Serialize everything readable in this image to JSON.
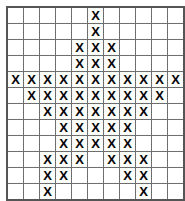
{
  "figure": {
    "type": "cross-stitch-pattern-grid",
    "columns": 11,
    "rows": 12,
    "mark_symbol": "X",
    "empty_symbol": "",
    "grid_line_color": "#6e6e6e",
    "border_color": "#555555",
    "mark_color": "#000000",
    "background_color": "#ffffff",
    "cells": [
      [
        "",
        "",
        "",
        "",
        "",
        "X",
        "",
        "",
        "",
        "",
        ""
      ],
      [
        "",
        "",
        "",
        "",
        "",
        "X",
        "",
        "",
        "",
        "",
        ""
      ],
      [
        "",
        "",
        "",
        "",
        "X",
        "X",
        "X",
        "",
        "",
        "",
        ""
      ],
      [
        "",
        "",
        "",
        "",
        "X",
        "X",
        "X",
        "",
        "",
        "",
        ""
      ],
      [
        "X",
        "X",
        "X",
        "X",
        "X",
        "X",
        "X",
        "X",
        "X",
        "X",
        "X"
      ],
      [
        "",
        "X",
        "X",
        "X",
        "X",
        "X",
        "X",
        "X",
        "X",
        "X",
        ""
      ],
      [
        "",
        "",
        "X",
        "X",
        "X",
        "X",
        "X",
        "X",
        "X",
        "",
        ""
      ],
      [
        "",
        "",
        "",
        "X",
        "X",
        "X",
        "X",
        "X",
        "",
        "",
        ""
      ],
      [
        "",
        "",
        "",
        "X",
        "X",
        "X",
        "X",
        "X",
        "",
        "",
        ""
      ],
      [
        "",
        "",
        "X",
        "X",
        "X",
        "",
        "X",
        "X",
        "X",
        "",
        ""
      ],
      [
        "",
        "",
        "X",
        "X",
        "",
        "",
        "",
        "X",
        "X",
        "",
        ""
      ],
      [
        "",
        "",
        "X",
        "",
        "",
        "",
        "",
        "",
        "X",
        "",
        ""
      ]
    ],
    "marked_cell_count": 71,
    "row_mark_counts": [
      1,
      1,
      3,
      3,
      11,
      9,
      7,
      5,
      5,
      6,
      4,
      2
    ]
  }
}
